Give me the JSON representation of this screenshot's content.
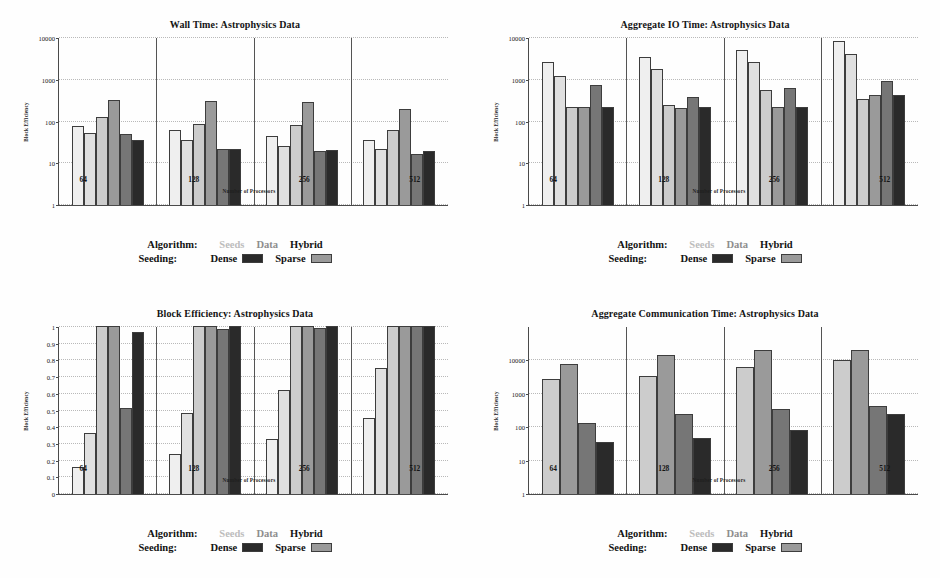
{
  "figure": {
    "panels": [
      "wall_time",
      "aggregate_io_time",
      "block_efficiency",
      "aggregate_communication_time"
    ]
  },
  "legend": {
    "algorithm_key": "Algorithm:",
    "seeding_key": "Seeding:",
    "algorithm_items": [
      {
        "label": "Seeds",
        "tone": "faint"
      },
      {
        "label": "Data",
        "tone": "mid"
      },
      {
        "label": "Hybrid",
        "tone": "dark"
      }
    ],
    "seeding_items": [
      {
        "label": "Dense",
        "swatch": "#2a2a2a"
      },
      {
        "label": "Sparse",
        "swatch": "#9a9a9a"
      }
    ]
  },
  "colors": {
    "series": [
      "#efefef",
      "#e0e0e0",
      "#cccccc",
      "#9a9a9a",
      "#767676",
      "#2a2a2a"
    ],
    "axis": "#4a4a4a",
    "grid": "#b9b9b9",
    "text": "#141414"
  },
  "chart_data": [
    {
      "id": "wall_time",
      "type": "bar",
      "title": "Wall Time: Astrophysics Data",
      "xlabel": "Number of Processors",
      "ylabel": "Block Efficiency",
      "yscale": "log",
      "ylim": [
        1,
        10000
      ],
      "yticks": [
        1,
        10,
        100,
        1000,
        10000
      ],
      "ytick_labels": [
        "1",
        "10",
        "100",
        "1000",
        "10000"
      ],
      "grid": true,
      "legend_position": "below",
      "categories": [
        "64",
        "128",
        "256",
        "512"
      ],
      "series": [
        {
          "name": "Seeds Dense",
          "values": [
            75,
            60,
            45,
            35
          ]
        },
        {
          "name": "Seeds Sparse",
          "values": [
            52,
            35,
            26,
            21
          ]
        },
        {
          "name": "Data Dense",
          "values": [
            125,
            85,
            82,
            60
          ]
        },
        {
          "name": "Data Sparse",
          "values": [
            320,
            300,
            285,
            195
          ]
        },
        {
          "name": "Hybrid Dense",
          "values": [
            50,
            21,
            19,
            16
          ]
        },
        {
          "name": "Hybrid Sparse",
          "values": [
            36,
            22,
            20,
            19
          ]
        }
      ]
    },
    {
      "id": "aggregate_io_time",
      "type": "bar",
      "title": "Aggregate IO Time: Astrophysics Data",
      "xlabel": "Number of Processors",
      "ylabel": "Block Efficiency",
      "yscale": "log",
      "ylim": [
        1,
        10000
      ],
      "yticks": [
        1,
        10,
        100,
        1000,
        10000
      ],
      "ytick_labels": [
        "1",
        "10",
        "100",
        "1000",
        "10000"
      ],
      "grid": true,
      "legend_position": "below",
      "categories": [
        "64",
        "128",
        "256",
        "512"
      ],
      "series": [
        {
          "name": "Seeds Dense",
          "values": [
            2500,
            3400,
            4800,
            8000
          ]
        },
        {
          "name": "Seeds Sparse",
          "values": [
            1200,
            1750,
            2500,
            4000
          ]
        },
        {
          "name": "Data Dense",
          "values": [
            215,
            240,
            540,
            330
          ]
        },
        {
          "name": "Data Sparse",
          "values": [
            215,
            200,
            215,
            420
          ]
        },
        {
          "name": "Hybrid Dense",
          "values": [
            710,
            380,
            600,
            900
          ]
        },
        {
          "name": "Hybrid Sparse",
          "values": [
            215,
            210,
            215,
            410
          ]
        }
      ]
    },
    {
      "id": "block_efficiency",
      "type": "bar",
      "title": "Block Efficiency: Astrophysics Data",
      "xlabel": "Number of Processors",
      "ylabel": "Block Efficiency",
      "yscale": "linear",
      "ylim": [
        0,
        1
      ],
      "yticks": [
        0,
        0.1,
        0.2,
        0.3,
        0.4,
        0.5,
        0.6,
        0.7,
        0.8,
        0.9,
        1
      ],
      "ytick_labels": [
        "0",
        "0.1",
        "0.2",
        "0.3",
        "0.4",
        "0.5",
        "0.6",
        "0.7",
        "0.8",
        "0.9",
        "1"
      ],
      "grid": true,
      "legend_position": "below",
      "categories": [
        "64",
        "128",
        "256",
        "512"
      ],
      "series": [
        {
          "name": "Seeds Dense",
          "values": [
            0.16,
            0.24,
            0.33,
            0.45
          ]
        },
        {
          "name": "Seeds Sparse",
          "values": [
            0.365,
            0.48,
            0.62,
            0.75
          ]
        },
        {
          "name": "Data Dense",
          "values": [
            1.0,
            1.0,
            1.0,
            1.0
          ]
        },
        {
          "name": "Data Sparse",
          "values": [
            1.0,
            1.0,
            1.0,
            1.0
          ]
        },
        {
          "name": "Hybrid Dense",
          "values": [
            0.51,
            0.985,
            0.99,
            1.0
          ]
        },
        {
          "name": "Hybrid Sparse",
          "values": [
            0.965,
            1.0,
            1.0,
            1.0
          ]
        }
      ]
    },
    {
      "id": "aggregate_communication_time",
      "type": "bar",
      "title": "Aggregate Communication Time: Astrophysics Data",
      "xlabel": "Number of Processors",
      "ylabel": "Block Efficiency",
      "yscale": "log",
      "ylim": [
        1,
        100000
      ],
      "yticks": [
        1,
        10,
        100,
        1000,
        10000
      ],
      "ytick_labels": [
        "1",
        "10",
        "100",
        "1000",
        "10000"
      ],
      "grid": true,
      "legend_position": "below",
      "categories": [
        "64",
        "128",
        "256",
        "512"
      ],
      "series": [
        {
          "name": "Data Dense",
          "values": [
            2600,
            3300,
            6000,
            10000
          ]
        },
        {
          "name": "Data Sparse",
          "values": [
            7500,
            14000,
            20000,
            20000
          ]
        },
        {
          "name": "Hybrid Dense",
          "values": [
            130,
            245,
            350,
            430
          ]
        },
        {
          "name": "Hybrid Sparse",
          "values": [
            36,
            48,
            83,
            235
          ]
        }
      ],
      "series_style_offset": 2
    }
  ]
}
